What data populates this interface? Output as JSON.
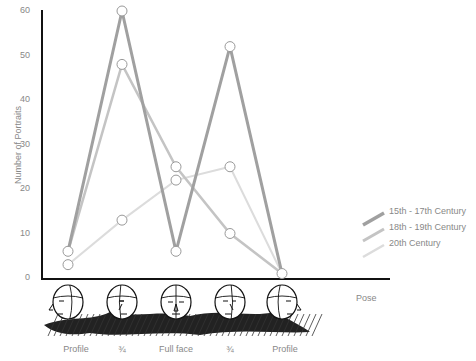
{
  "chart_data": {
    "type": "line",
    "title": "",
    "xlabel": "Pose",
    "ylabel": "Number of Portraits",
    "ylim": [
      0,
      60
    ],
    "yticks": [
      0,
      10,
      20,
      30,
      40,
      50,
      60
    ],
    "categories": [
      "Profile",
      "¾",
      "Full face",
      "¾",
      "Profile"
    ],
    "series": [
      {
        "name": "15th - 17th Century",
        "values": [
          6,
          60,
          6,
          52,
          1
        ],
        "color": "#a0a0a0",
        "width": 3
      },
      {
        "name": "18th - 19th Century",
        "values": [
          6,
          48,
          25,
          10,
          1
        ],
        "color": "#c4c4c4",
        "width": 2.5
      },
      {
        "name": "20th Century",
        "values": [
          3,
          13,
          22,
          25,
          1
        ],
        "color": "#dcdcdc",
        "width": 2
      }
    ],
    "legend_position": "right",
    "grid": false,
    "markers": "open-circle"
  },
  "labels": {
    "ylabel": "Number of Portraits",
    "xlabel": "Pose",
    "yticks": [
      "0",
      "10",
      "20",
      "30",
      "40",
      "50",
      "60"
    ],
    "categories": [
      "Profile",
      "¾",
      "Full face",
      "¾",
      "Profile"
    ],
    "legend": [
      "15th - 17th Century",
      "18th - 19th Century",
      "20th Century"
    ]
  }
}
